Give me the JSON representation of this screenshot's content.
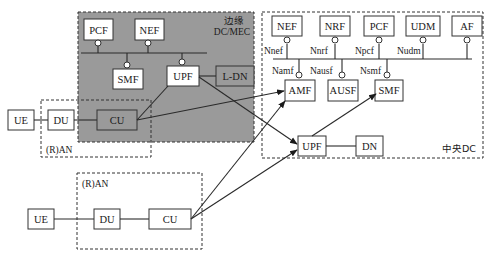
{
  "edge_dc": {
    "title_line1": "边缘",
    "title_line2": "DC/MEC",
    "background": "#9a9a9a",
    "nfs": {
      "pcf": "PCF",
      "nef": "NEF",
      "smf": "SMF",
      "upf": "UPF",
      "ldn": "L-DN",
      "cu": "CU"
    }
  },
  "ran_top": {
    "label": "(R)AN",
    "ue": "UE",
    "du": "DU"
  },
  "ran_bottom": {
    "label": "(R)AN",
    "ue": "UE",
    "du": "DU",
    "cu": "CU"
  },
  "central_dc": {
    "title": "中央DC",
    "nfs": {
      "nef": "NEF",
      "nrf": "NRF",
      "pcf": "PCF",
      "udm": "UDM",
      "af": "AF",
      "amf": "AMF",
      "ausf": "AUSF",
      "smf": "SMF",
      "upf": "UPF",
      "dn": "DN"
    },
    "interfaces": {
      "nnef": "Nnef",
      "nnrf": "Nnrf",
      "npcf": "Npcf",
      "nudm": "Nudm",
      "namf": "Namf",
      "nausf": "Nausf",
      "nsmf": "Nsmf"
    }
  }
}
